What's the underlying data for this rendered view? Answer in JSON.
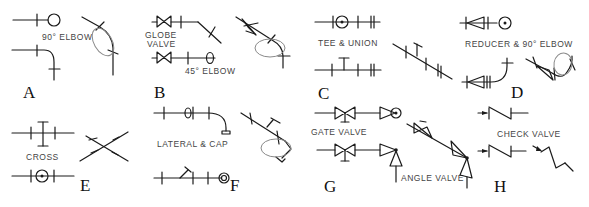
{
  "panels": [
    {
      "letter": "A",
      "labels": [
        "90° ELBOW"
      ]
    },
    {
      "letter": "B",
      "labels": [
        "GLOBE",
        "VALVE",
        "45° ELBOW"
      ]
    },
    {
      "letter": "C",
      "labels": [
        "TEE & UNION"
      ]
    },
    {
      "letter": "D",
      "labels": [
        "REDUCER & 90° ELBOW"
      ]
    },
    {
      "letter": "E",
      "labels": [
        "CROSS"
      ]
    },
    {
      "letter": "F",
      "labels": [
        "LATERAL & CAP"
      ]
    },
    {
      "letter": "G",
      "labels": [
        "GATE VALVE",
        "ANGLE VALVE"
      ]
    },
    {
      "letter": "H",
      "labels": [
        "CHECK VALVE"
      ]
    }
  ]
}
